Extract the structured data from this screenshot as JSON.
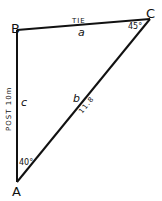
{
  "diagram": {
    "type": "triangle",
    "vertices": {
      "A": {
        "label": "A",
        "angle": "40°"
      },
      "B": {
        "label": "B"
      },
      "C": {
        "label": "C",
        "angle": "45°"
      }
    },
    "sides": {
      "a": {
        "letter": "a",
        "name": "TIE"
      },
      "b": {
        "letter": "b",
        "name": "11.8"
      },
      "c": {
        "letter": "c",
        "name": "POST 10m"
      }
    },
    "line_color": "#111111"
  }
}
